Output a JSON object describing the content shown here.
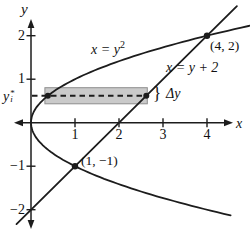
{
  "figure": {
    "bg": "#ffffff",
    "ink": "#1c1c1c",
    "strip_fill": "#cacaca",
    "strip_stroke": "#8e8e8e"
  },
  "chart_data": {
    "type": "line",
    "axis_labels": {
      "x": "x",
      "y": "y"
    },
    "x_ticks": [
      {
        "v": 1,
        "label": "1"
      },
      {
        "v": 2,
        "label": "2"
      },
      {
        "v": 3,
        "label": "3"
      },
      {
        "v": 4,
        "label": "4"
      }
    ],
    "y_ticks": [
      {
        "v": 2,
        "label": "2"
      },
      {
        "v": 1,
        "label": "1"
      },
      {
        "v": -1,
        "label": "−1"
      },
      {
        "v": -2,
        "label": "−2"
      }
    ],
    "xlim": [
      -0.45,
      5.0
    ],
    "ylim": [
      -2.6,
      2.35
    ],
    "curves": [
      {
        "id": "parabola",
        "equation": "x = y^2",
        "label_base": "x = y",
        "label_sup": "2",
        "y_range": [
          -2.13,
          2.26
        ]
      },
      {
        "id": "line",
        "equation": "x = y + 2",
        "label_base": "x = y + 2",
        "y_range": [
          -2.33,
          2.68
        ]
      }
    ],
    "intersection_points": [
      {
        "x": 4,
        "y": 2,
        "label": "(4, 2)"
      },
      {
        "x": 1,
        "y": -1,
        "label": "(1, −1)"
      }
    ],
    "strip": {
      "y_star": 0.62,
      "delta_y": 0.37,
      "label_base": "y",
      "label_sup": "*",
      "label_sub": "i",
      "brace": "}",
      "delta_label": "Δy"
    }
  }
}
